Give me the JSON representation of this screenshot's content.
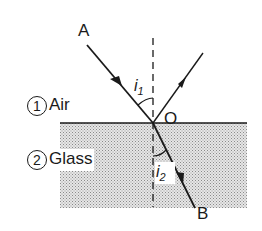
{
  "diagram": {
    "type": "refraction-ray-diagram",
    "colors": {
      "line": "#1a1a1a",
      "glass_fill": "#d4d4d4",
      "background": "#ffffff"
    },
    "points": {
      "incident_start": {
        "label": "A"
      },
      "point_of_incidence": {
        "label": "O"
      },
      "refracted_end": {
        "label": "B"
      }
    },
    "angles": {
      "incidence": {
        "symbol": "i",
        "subscript": "1"
      },
      "refraction": {
        "symbol": "i",
        "subscript": "2"
      }
    },
    "media": [
      {
        "number": "1",
        "name": "Air"
      },
      {
        "number": "2",
        "name": "Glass"
      }
    ]
  }
}
